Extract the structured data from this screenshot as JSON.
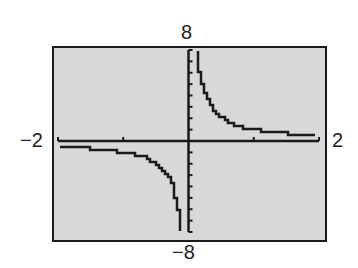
{
  "chart_data": {
    "type": "line",
    "title": "",
    "function": "y = 1/x",
    "xlabel": "",
    "ylabel": "",
    "xlim": [
      -2,
      2
    ],
    "ylim": [
      -8,
      8
    ],
    "xscale": 1,
    "yscale": 1,
    "grid": false,
    "window_labels": {
      "xmin": "−2",
      "xmax": "2",
      "ymin": "−8",
      "ymax": "8"
    },
    "x": [
      -1.95,
      -1.5,
      -1.0,
      -0.75,
      -0.5,
      -0.35,
      -0.25,
      -0.18,
      -0.14,
      -0.125,
      0.125,
      0.14,
      0.18,
      0.25,
      0.35,
      0.5,
      0.75,
      1.0,
      1.5,
      1.95
    ],
    "y": [
      -0.51,
      -0.67,
      -1.0,
      -1.33,
      -2.0,
      -2.86,
      -4.0,
      -5.56,
      -7.14,
      -8.0,
      8.0,
      7.14,
      5.56,
      4.0,
      2.86,
      2.0,
      1.33,
      1.0,
      0.67,
      0.51
    ]
  },
  "colors": {
    "screen": "#d8d8d8",
    "ink": "#1a1a1a"
  }
}
